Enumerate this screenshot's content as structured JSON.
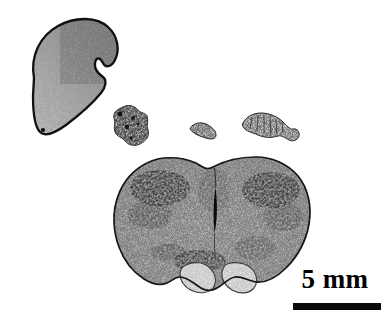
{
  "figure": {
    "kind": "histological-micrograph",
    "modality": "grayscale brightfield tissue section photograph",
    "background_color": "#ffffff",
    "ink_color": "#000000",
    "width_px": 387,
    "height_px": 328
  },
  "scalebar": {
    "label": "5 mm",
    "value": 5,
    "unit": "mm",
    "bar_color": "#0a0a0a",
    "bar_x_px": 293,
    "bar_y_px": 303,
    "bar_length_px": 88,
    "bar_thickness_px": 7,
    "label_position": "above-bar"
  },
  "specimens": [
    {
      "name": "bean-shaped-organ",
      "position": "top-left",
      "description": "large kidney/bean shaped sectioned organ with dark continuous outline, grainy mid-gray interior that is darker toward the upper right and lighter at the lower left, and a sharp concave notch on its right margin",
      "outline_color": "#141414",
      "fill_tone": "medium gray stipple",
      "bbox_px": [
        18,
        16,
        122,
        137
      ]
    },
    {
      "name": "tissue-fragment-left",
      "position": "middle-left",
      "description": "small irregular clumped tissue fragment with dark granular speckles",
      "bbox_px": [
        110,
        105,
        150,
        150
      ]
    },
    {
      "name": "tissue-fragment-center",
      "position": "middle-center",
      "description": "small elongated comma-shaped tissue fragment",
      "bbox_px": [
        190,
        120,
        218,
        140
      ]
    },
    {
      "name": "tissue-fragment-right",
      "position": "middle-right",
      "description": "elongated banded worm-like tissue fragment with a small round lobe at its right end",
      "bbox_px": [
        240,
        110,
        300,
        142
      ]
    },
    {
      "name": "bilateral-brain-section",
      "position": "bottom-center",
      "description": "large bilaterally symmetric coronal nervous-tissue section with a dark vertical midline cleft, densely speckled dorsolateral neuropil regions, a thin dark perimeter outline, and two pale rounded ventral lobes at the bottom",
      "outline_color": "#1a1a1a",
      "fill_tone": "light gray stipple with dark cell clusters",
      "bbox_px": [
        113,
        155,
        312,
        296
      ],
      "features": [
        "midline-cleft",
        "left-hemisphere",
        "right-hemisphere",
        "ventral-lobe-left",
        "ventral-lobe-right",
        "dorsolateral-dark-cluster-left",
        "dorsolateral-dark-cluster-right"
      ]
    }
  ]
}
